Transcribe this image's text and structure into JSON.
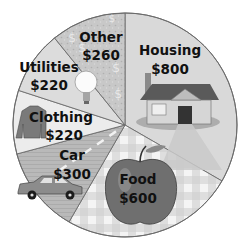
{
  "chart_data": {
    "type": "pie",
    "title": "",
    "currency": "$",
    "total": 2400,
    "start_angle_deg": 0,
    "direction": "clockwise",
    "center": [
      125,
      125
    ],
    "radius": 112,
    "slices": [
      {
        "label": "Housing",
        "value": 800,
        "display": "$800",
        "fill": "#d9d9d9",
        "icon": "house-icon",
        "label_pos": [
          170,
          55
        ],
        "value_pos": [
          170,
          74
        ]
      },
      {
        "label": "Food",
        "value": 600,
        "display": "$600",
        "fill": "#e6e6e6",
        "icon": "apple-icon",
        "label_pos": [
          138,
          184
        ],
        "value_pos": [
          138,
          203
        ]
      },
      {
        "label": "Car",
        "value": 300,
        "display": "$300",
        "fill": "#b7b7b7",
        "icon": "car-icon",
        "label_pos": [
          72,
          160
        ],
        "value_pos": [
          72,
          179
        ]
      },
      {
        "label": "Clothing",
        "value": 220,
        "display": "$220",
        "fill": "#ececec",
        "icon": "sweater-icon",
        "label_pos": [
          61,
          122
        ],
        "value_pos": [
          64,
          140
        ]
      },
      {
        "label": "Utilities",
        "value": 220,
        "display": "$220",
        "fill": "#dcdcdc",
        "icon": "lightbulb-icon",
        "label_pos": [
          49,
          72
        ],
        "value_pos": [
          49,
          90
        ]
      },
      {
        "label": "Other",
        "value": 260,
        "display": "$260",
        "fill": "#c4c4c4",
        "icon": "dollar-sign-icon",
        "label_pos": [
          101,
          42
        ],
        "value_pos": [
          101,
          60
        ]
      }
    ],
    "legend": "none",
    "xlabel": "",
    "ylabel": ""
  },
  "colors": {
    "outline": "#6b6b6b",
    "text": "#111111",
    "background": "#ffffff"
  }
}
